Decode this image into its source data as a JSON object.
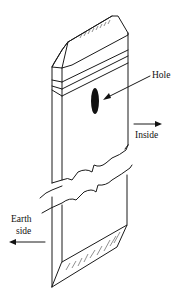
{
  "diagram": {
    "labels": {
      "hole": "Hole",
      "inside": "Inside",
      "earth_side_line1": "Earth",
      "earth_side_line2": "side"
    },
    "colors": {
      "line": "#1a1a1a",
      "hole_fill": "#111111",
      "background": "#ffffff"
    }
  }
}
